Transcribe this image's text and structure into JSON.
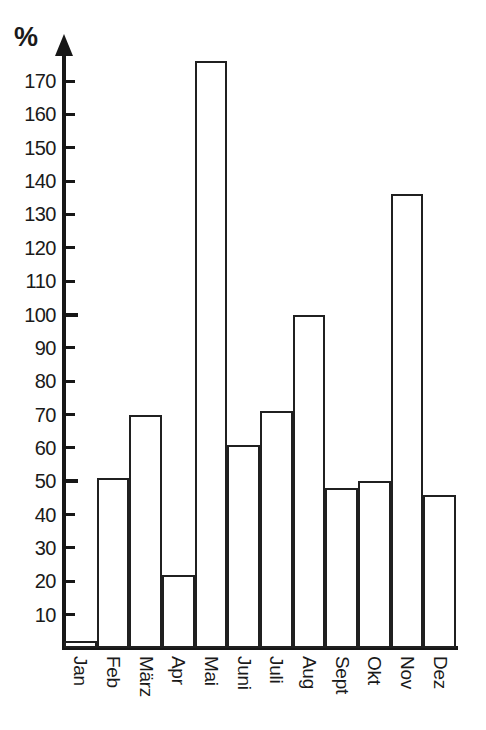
{
  "chart_data": {
    "type": "bar",
    "title": "",
    "xlabel": "",
    "ylabel": "%",
    "unit_label": "%",
    "ylim": [
      0,
      180
    ],
    "grid": false,
    "legend": null,
    "axis_style": "arrow-up",
    "tick_interval": 10,
    "major_ticks": [
      50,
      100
    ],
    "yticks": [
      10,
      20,
      30,
      40,
      50,
      60,
      70,
      80,
      90,
      100,
      110,
      120,
      130,
      140,
      150,
      160,
      170
    ],
    "ytick_labels": [
      "10",
      "20",
      "30",
      "40",
      "50",
      "60",
      "70",
      "80",
      "90",
      "100",
      "110",
      "120",
      "130",
      "140",
      "150",
      "160",
      "170"
    ],
    "categories": [
      "Jan",
      "Feb",
      "März",
      "Apr",
      "Mai",
      "Juni",
      "Juli",
      "Aug",
      "Sept",
      "Okt",
      "Nov",
      "Dez"
    ],
    "values": [
      2,
      51,
      70,
      22,
      176,
      61,
      71,
      100,
      48,
      50,
      136,
      46
    ],
    "bar_style": {
      "fill": "#ffffff",
      "stroke": "#202020",
      "stroke_width": 2.5,
      "gap": 0
    },
    "background": "#ffffff",
    "foreground": "#171717"
  }
}
